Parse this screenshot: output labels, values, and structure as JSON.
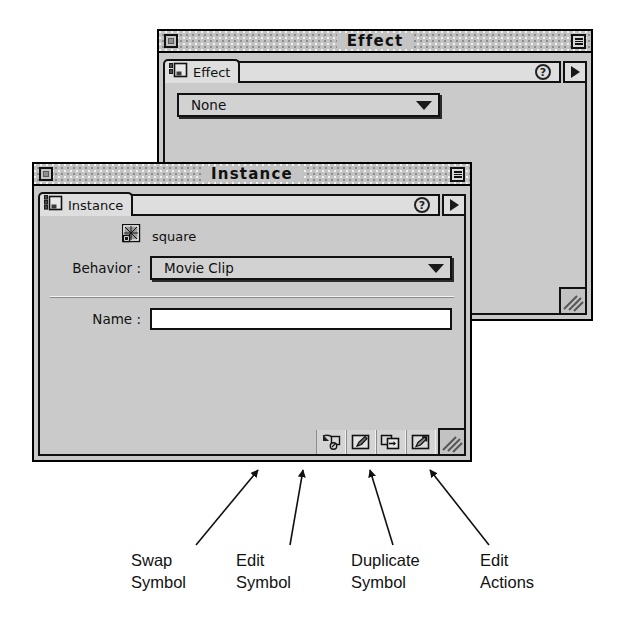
{
  "effect_window": {
    "title": "Effect",
    "close_box": "close-box",
    "zoom_box": "zoom-box",
    "tab": {
      "label": "Effect",
      "icon": "panel-tab-icon"
    },
    "help_badge": "?",
    "tab_arrow": "chevron-right-icon",
    "effect_popup": {
      "value": "None",
      "arrow": "chevron-down-icon"
    },
    "grip": "resize-grip-icon"
  },
  "instance_window": {
    "title": "Instance",
    "close_box": "close-box",
    "zoom_box": "zoom-box",
    "tab": {
      "label": "Instance",
      "icon": "panel-tab-icon"
    },
    "help_badge": "?",
    "tab_arrow": "chevron-right-icon",
    "symbol": {
      "icon": "movie-clip-symbol-icon",
      "name": "square"
    },
    "behavior": {
      "label": "Behavior :",
      "value": "Movie Clip",
      "arrow": "chevron-down-icon"
    },
    "name_field": {
      "label": "Name :",
      "value": "",
      "placeholder": ""
    },
    "toolbar": [
      {
        "name": "swap-symbol-button",
        "icon": "swap-symbol-icon"
      },
      {
        "name": "edit-symbol-button",
        "icon": "edit-symbol-icon"
      },
      {
        "name": "duplicate-symbol-button",
        "icon": "duplicate-symbol-icon"
      },
      {
        "name": "edit-actions-button",
        "icon": "edit-actions-icon"
      }
    ],
    "grip": "resize-grip-icon"
  },
  "annotations": [
    {
      "line1": "Swap",
      "line2": "Symbol"
    },
    {
      "line1": "Edit",
      "line2": "Symbol"
    },
    {
      "line1": "Duplicate",
      "line2": "Symbol"
    },
    {
      "line1": "Edit",
      "line2": "Actions"
    }
  ],
  "colors": {
    "window_face": "#c9c9c9",
    "panel_face": "#cacaca",
    "outline": "#000000",
    "field_bg": "#ffffff",
    "titlebar": "#c2c2c2"
  }
}
